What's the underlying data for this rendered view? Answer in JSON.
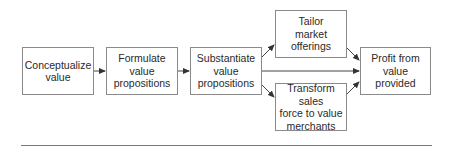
{
  "diagram": {
    "type": "flowchart",
    "nodes": [
      {
        "id": "conceptualize",
        "label": "Conceptualize\nvalue"
      },
      {
        "id": "formulate",
        "label": "Formulate\nvalue\npropositions"
      },
      {
        "id": "substantiate",
        "label": "Substantiate\nvalue\npropositions"
      },
      {
        "id": "tailor",
        "label": "Tailor\nmarket\nofferings"
      },
      {
        "id": "transform",
        "label": "Transform sales\nforce to value\nmerchants"
      },
      {
        "id": "profit",
        "label": "Profit from\nvalue\nprovided"
      }
    ],
    "edges": [
      {
        "from": "conceptualize",
        "to": "formulate"
      },
      {
        "from": "formulate",
        "to": "substantiate"
      },
      {
        "from": "substantiate",
        "to": "tailor"
      },
      {
        "from": "substantiate",
        "to": "profit"
      },
      {
        "from": "substantiate",
        "to": "transform"
      },
      {
        "from": "tailor",
        "to": "profit"
      },
      {
        "from": "transform",
        "to": "profit"
      }
    ],
    "colors": {
      "border": "#8a8a8a",
      "arrow": "#333333",
      "rule": "#777777"
    }
  }
}
